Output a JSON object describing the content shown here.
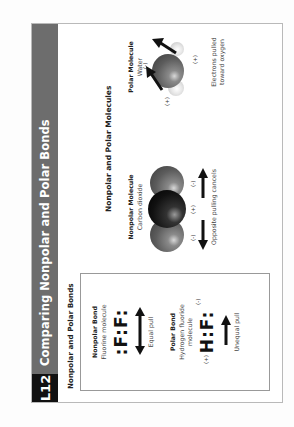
{
  "header": {
    "lesson_badge": "L12",
    "title": "Comparing Nonpolar and Polar Bonds"
  },
  "left_panel": {
    "title": "Nonpolar and Polar Bonds",
    "nonpolar_bond": {
      "heading": "Nonpolar Bond",
      "subtitle": "Fluorine molecule",
      "formula": ":F:F:",
      "caption": "Equal pull"
    },
    "polar_bond": {
      "heading": "Polar Bond",
      "subtitle_line1": "Hydrogen fluoride",
      "subtitle_line2": "molecule",
      "formula": "H:F:",
      "charge_positive": "(+)",
      "charge_negative": "(-)",
      "caption": "Unequal pull"
    }
  },
  "right_panel": {
    "title": "Nonpolar and Polar Molecules",
    "nonpolar_molecule": {
      "heading": "Nonpolar Molecule",
      "subtitle": "Carbon dioxide",
      "charges": [
        "(-)",
        "(+)",
        "(-)"
      ],
      "caption": "Opposite pulling cancels"
    },
    "polar_molecule": {
      "heading": "Polar Molecule",
      "subtitle": "Water",
      "charge_negative": "(-)",
      "charge_positive_left": "(+)",
      "charge_positive_right": "(+)",
      "caption_line1": "Electrons pulled",
      "caption_line2": "toward oxygen"
    }
  },
  "colors": {
    "header_band": "#6d6d6d",
    "badge": "#111111",
    "frame_border": "#b9b9b9"
  }
}
